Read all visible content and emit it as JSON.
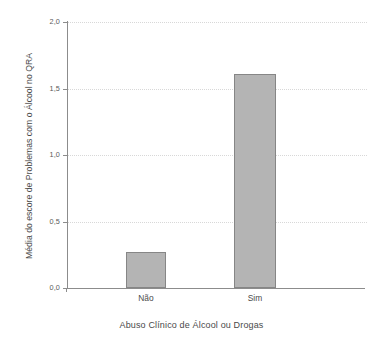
{
  "chart_data": {
    "type": "bar",
    "title": "",
    "categories": [
      "Não",
      "Sim"
    ],
    "values": [
      0.27,
      1.61
    ],
    "xlabel": "Abuso Clínico de Álcool ou Drogas",
    "ylabel": "Média do escore de Problemas com o Álcool no QRA",
    "ylim": [
      0.0,
      2.0
    ],
    "yticks": [
      "0,0",
      "0,5",
      "1,0",
      "1,5",
      "2,0"
    ],
    "ytick_values": [
      0.0,
      0.5,
      1.0,
      1.5,
      2.0
    ],
    "grid": "horizontal-dotted",
    "legend": "none",
    "bar_fill_color": "#b4b4b4",
    "bar_border_color": "#868686",
    "axis_color": "#8c8c8c",
    "gridline_color": "#d8d8d8",
    "background_color": "#ffffff"
  }
}
